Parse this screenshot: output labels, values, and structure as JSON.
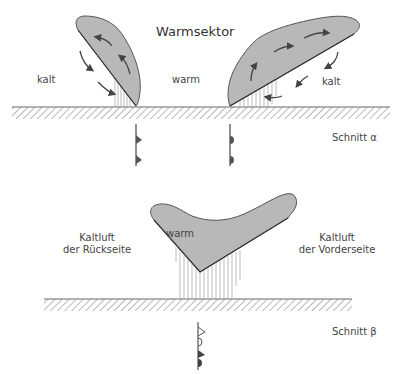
{
  "diagram": {
    "top_section": {
      "title": "Warmsektor",
      "left_air_label": "kalt",
      "center_air_label": "warm",
      "right_air_label": "kalt",
      "section_label": "Schnitt α",
      "fronts": [
        {
          "type": "cold-front",
          "symbol": "triangles"
        },
        {
          "type": "warm-front",
          "symbol": "semicircles"
        }
      ]
    },
    "bottom_section": {
      "cloud_label": "warm",
      "left_air_label_line1": "Kaltluft",
      "left_air_label_line2": "der Rückseite",
      "right_air_label_line1": "Kaltluft",
      "right_air_label_line2": "der Vorderseite",
      "section_label": "Schnitt β",
      "fronts": [
        {
          "type": "occluded-front",
          "symbol": "open-triangles-and-semicircles"
        }
      ]
    },
    "colors": {
      "cloud_fill": "#b8b8b8",
      "cloud_edge": "#555555",
      "ground_hatch": "#777777",
      "arrow": "#444444",
      "text": "#444444"
    }
  }
}
